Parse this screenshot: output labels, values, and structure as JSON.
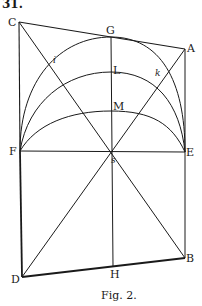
{
  "header": {
    "text": "31."
  },
  "figure": {
    "caption": "Fig. 2.",
    "points": {
      "C": {
        "label": "C",
        "x": 19,
        "y": 22
      },
      "G": {
        "label": "G",
        "x": 111,
        "y": 37
      },
      "A": {
        "label": "A",
        "x": 185,
        "y": 49
      },
      "i": {
        "label": "i",
        "x": 56,
        "y": 60
      },
      "k": {
        "label": "k",
        "x": 158,
        "y": 73
      },
      "L": {
        "label": "L",
        "x": 111,
        "y": 72
      },
      "M": {
        "label": "M",
        "x": 111,
        "y": 111
      },
      "F": {
        "label": "F",
        "x": 20,
        "y": 151
      },
      "E": {
        "label": "E",
        "x": 185,
        "y": 152
      },
      "s": {
        "label": "s",
        "x": 111,
        "y": 152
      },
      "D": {
        "label": "D",
        "x": 22,
        "y": 277
      },
      "H": {
        "label": "H",
        "x": 113,
        "y": 266
      },
      "B": {
        "label": "B",
        "x": 185,
        "y": 258
      }
    },
    "colors": {
      "ink": "#1a1a1a",
      "paper": "#ffffff"
    }
  }
}
